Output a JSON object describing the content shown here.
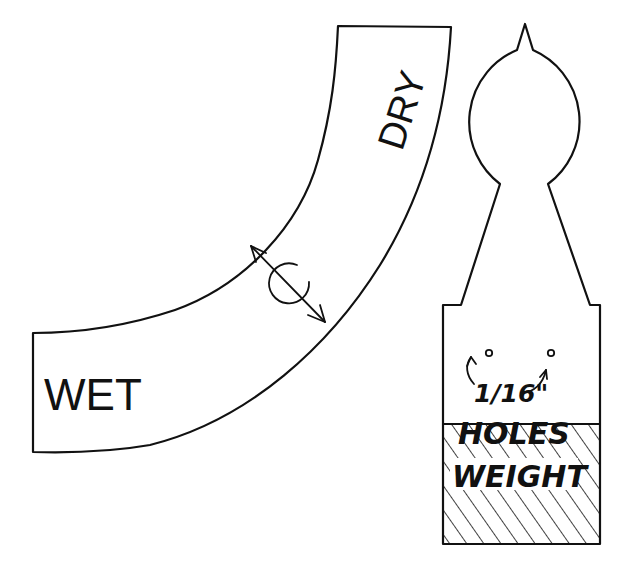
{
  "diagram": {
    "arc_scale": {
      "labels": {
        "wet": "WET",
        "dry": "DRY"
      },
      "indicator": {
        "symbol": "rotation-symbol",
        "description": "double-headed arrow across band with circular rotation mark"
      }
    },
    "indicator_piece": {
      "hole_note": {
        "size": "1/16\"",
        "label": "HOLES"
      },
      "weight_label": "WEIGHT"
    },
    "colors": {
      "ink": "#111111",
      "paper": "#ffffff"
    }
  }
}
